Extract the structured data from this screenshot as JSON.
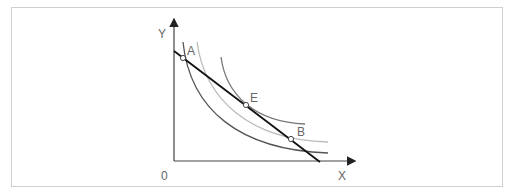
{
  "diagram": {
    "type": "indifference-curves-budget-line",
    "axes": {
      "y_label": "Y",
      "x_label": "X",
      "origin_label": "0"
    },
    "points": [
      {
        "label": "A",
        "x": 183,
        "y": 58
      },
      {
        "label": "E",
        "x": 246,
        "y": 105
      },
      {
        "label": "B",
        "x": 291,
        "y": 139
      }
    ],
    "curves": [
      {
        "name": "indifference-curve-low",
        "color": "#555555"
      },
      {
        "name": "indifference-curve-mid",
        "color": "#bbbbbb"
      },
      {
        "name": "indifference-curve-high",
        "color": "#777777"
      }
    ],
    "budget_line_color": "#111111"
  }
}
